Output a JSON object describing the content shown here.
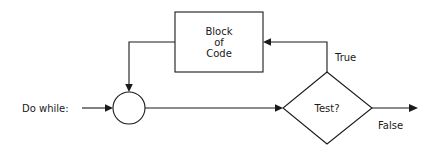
{
  "diagram": {
    "type": "flowchart",
    "background_color": "#ffffff",
    "line_color": "#1a1a1a",
    "text_color": "#1a1a1a",
    "entry_label": "Do while:",
    "nodes": [
      {
        "id": "junction",
        "shape": "circle",
        "label": "",
        "cx": 129,
        "cy": 108,
        "r": 16
      },
      {
        "id": "block-of-code",
        "shape": "rectangle",
        "label_lines": [
          "Block",
          "of",
          "Code"
        ],
        "x": 175,
        "y": 12,
        "width": 88,
        "height": 60
      },
      {
        "id": "test-decision",
        "shape": "diamond",
        "label": "Test?",
        "cx": 327,
        "cy": 108,
        "half_width": 45,
        "half_height": 36
      }
    ],
    "edges": [
      {
        "id": "entry-to-junction",
        "from": "entry",
        "to": "junction",
        "label": "",
        "arrow": true
      },
      {
        "id": "junction-to-test",
        "from": "junction",
        "to": "test-decision",
        "label": "",
        "arrow": true
      },
      {
        "id": "test-true-to-block",
        "from": "test-decision",
        "to": "block-of-code",
        "label": "True",
        "arrow": true
      },
      {
        "id": "block-to-junction",
        "from": "block-of-code",
        "to": "junction",
        "label": "",
        "arrow": true
      },
      {
        "id": "test-false-to-exit",
        "from": "test-decision",
        "to": "exit",
        "label": "False",
        "arrow": true
      }
    ],
    "labels": {
      "entry": "Do while:",
      "block_line_1": "Block",
      "block_line_2": "of",
      "block_line_3": "Code",
      "decision": "Test?",
      "true_branch": "True",
      "false_branch": "False"
    }
  }
}
